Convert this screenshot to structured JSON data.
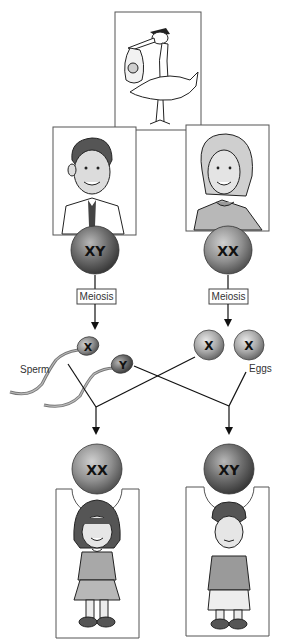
{
  "diagram": {
    "top": {
      "image": "stork-carrying-baby-icon"
    },
    "parents": [
      {
        "role": "father",
        "image": "man-portrait-icon",
        "chromosomes": "XY"
      },
      {
        "role": "mother",
        "image": "woman-portrait-icon",
        "chromosomes": "XX"
      }
    ],
    "process_labels": {
      "left": "Meiosis",
      "right": "Meiosis"
    },
    "gametes": {
      "sperm_label": "Sperm",
      "eggs_label": "Eggs",
      "sperm": [
        {
          "chromosome": "X"
        },
        {
          "chromosome": "Y"
        }
      ],
      "eggs": [
        {
          "chromosome": "X"
        },
        {
          "chromosome": "X"
        }
      ]
    },
    "offspring": [
      {
        "role": "daughter",
        "image": "girl-portrait-icon",
        "chromosomes": "XX"
      },
      {
        "role": "son",
        "image": "boy-portrait-icon",
        "chromosomes": "XY"
      }
    ],
    "colors": {
      "sphere_light": "#d8d8d8",
      "sphere_mid": "#9a9a9a",
      "sphere_dark": "#5a5a5a",
      "sphere_dark_alt": "#3f3f3f",
      "line": "#111111",
      "frame": "#555555"
    }
  }
}
